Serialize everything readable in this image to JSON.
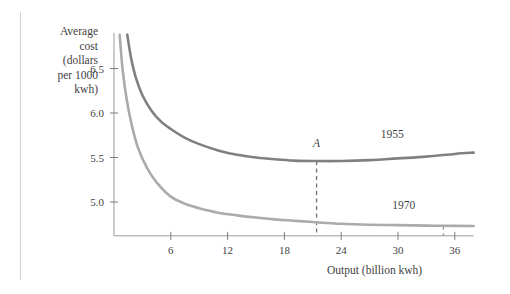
{
  "page": {
    "background_color": "#ffffff",
    "margin_rule_color": "#d2d2d2"
  },
  "chart_data": {
    "type": "line",
    "title": "",
    "xlabel": "Output (billion kwh)",
    "ylabel": "Average cost (dollars per 1000 kwh)",
    "ylabel_lines": [
      "Average",
      "cost",
      "(dollars",
      "per 1000",
      "kwh)"
    ],
    "grid": false,
    "legend": "inline-labels",
    "xlim": [
      0,
      38
    ],
    "ylim": [
      4.62,
      6.9
    ],
    "xticks": [
      6,
      12,
      18,
      24,
      30,
      36
    ],
    "xticklabels": [
      "6",
      "12",
      "18",
      "24",
      "30",
      "36"
    ],
    "yticks": [
      5.0,
      5.5,
      6.0,
      6.5
    ],
    "yticklabels": [
      "5.0",
      "5.5",
      "6.0",
      "6.5"
    ],
    "series": [
      {
        "name": "1955",
        "label": "1955",
        "color": "#808080",
        "label_x": 29.4,
        "label_y": 5.72,
        "x": [
          1.4,
          1.8,
          2.3,
          3.0,
          4.0,
          5.0,
          6.0,
          7.5,
          9.0,
          11.0,
          13.0,
          15.0,
          17.0,
          19.0,
          21.0,
          24.0,
          27.0,
          30.0,
          33.0,
          36.0,
          38.0
        ],
        "y": [
          6.88,
          6.62,
          6.4,
          6.2,
          6.02,
          5.9,
          5.82,
          5.72,
          5.65,
          5.58,
          5.53,
          5.5,
          5.48,
          5.465,
          5.46,
          5.46,
          5.47,
          5.49,
          5.51,
          5.54,
          5.555
        ]
      },
      {
        "name": "1970",
        "label": "1970",
        "color": "#ababab",
        "label_x": 30.6,
        "label_y": 4.92,
        "x": [
          0.6,
          0.9,
          1.3,
          1.8,
          2.5,
          3.5,
          4.5,
          6.0,
          7.5,
          9.0,
          11.0,
          13.0,
          15.0,
          17.0,
          19.0,
          21.0,
          24.0,
          27.0,
          30.0,
          33.0,
          36.0,
          38.0
        ],
        "y": [
          6.88,
          6.5,
          6.18,
          5.9,
          5.62,
          5.38,
          5.22,
          5.06,
          4.98,
          4.93,
          4.88,
          4.85,
          4.825,
          4.805,
          4.79,
          4.775,
          4.755,
          4.745,
          4.74,
          4.735,
          4.732,
          4.73
        ]
      }
    ],
    "annotations": [
      {
        "name": "point-A",
        "label": "A",
        "x": 21.4,
        "y": 5.46,
        "label_y": 5.62,
        "dropline": true,
        "dropline_style": "dashed",
        "dropline_color": "#707070",
        "dropline_to_y": 4.62
      },
      {
        "name": "point-min-1970",
        "label": "",
        "x": 34.8,
        "y": 4.733,
        "label_y": null,
        "dropline": true,
        "dropline_style": "dashed",
        "dropline_color": "#9a9a9a",
        "dropline_to_y": 4.62
      }
    ],
    "axis_color": "#9a9a9a",
    "tick_color": "#7d7d7d"
  }
}
